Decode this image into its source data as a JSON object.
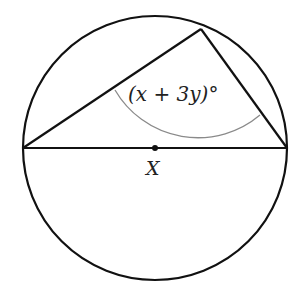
{
  "diagram": {
    "angle_label": "(x + 3y)°",
    "center_label": "X",
    "colors": {
      "stroke": "#111111",
      "arc": "#8a8a8a",
      "background": "#ffffff"
    }
  }
}
